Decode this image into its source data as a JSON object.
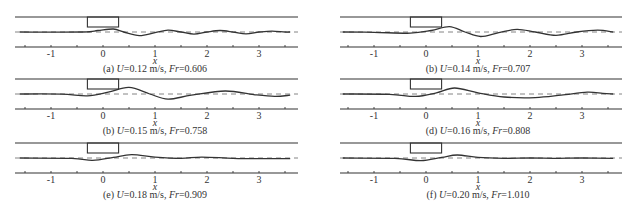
{
  "figure": {
    "x_axis_label": "x",
    "x_ticks": [
      "-1",
      "0",
      "1",
      "2",
      "3"
    ],
    "x_tick_values": [
      -1,
      0,
      1,
      2,
      3
    ],
    "x_range": [
      -1.6,
      3.6
    ]
  },
  "chart_data": [
    {
      "type": "line",
      "id": "a",
      "title": "(a) U=0.12 m/s, Fr=0.606",
      "caption_prefix": "(a) ",
      "U": "0.12",
      "Fr": "0.606",
      "xlabel": "x",
      "xlim": [
        -1.6,
        3.6
      ],
      "obstacle": {
        "x_start": -0.3,
        "x_end": 0.3
      },
      "series": [
        {
          "name": "free surface",
          "x": [
            -1.6,
            -0.4,
            -0.1,
            0.2,
            0.4,
            0.7,
            1.0,
            1.25,
            1.5,
            1.75,
            2.0,
            2.25,
            2.5,
            2.75,
            3.0,
            3.25,
            3.5,
            3.6
          ],
          "y": [
            0,
            0,
            0.25,
            0.5,
            0,
            -0.6,
            -0.1,
            0.3,
            0,
            -0.35,
            0,
            0.25,
            0,
            -0.3,
            0,
            0.15,
            0,
            0
          ]
        },
        {
          "name": "still water level",
          "style": "dashed",
          "y": 0
        }
      ]
    },
    {
      "type": "line",
      "id": "b1",
      "title": "(b) U=0.14 m/s, Fr=0.707",
      "caption_prefix": "(b) ",
      "U": "0.14",
      "Fr": "0.707",
      "xlabel": "x",
      "xlim": [
        -1.6,
        3.6
      ],
      "obstacle": {
        "x_start": -0.3,
        "x_end": 0.3
      },
      "series": [
        {
          "name": "free surface",
          "x": [
            -1.6,
            -1.0,
            -0.3,
            0.1,
            0.45,
            0.75,
            1.05,
            1.4,
            1.75,
            2.1,
            2.5,
            2.9,
            3.3,
            3.6
          ],
          "y": [
            0,
            -0.05,
            -0.2,
            0.25,
            0.9,
            0,
            -0.75,
            -0.1,
            0.45,
            0,
            -0.55,
            0,
            0.3,
            0
          ]
        },
        {
          "name": "still water level",
          "style": "dashed",
          "y": 0
        }
      ]
    },
    {
      "type": "line",
      "id": "b2",
      "title": "(b) U=0.15 m/s, Fr=0.758",
      "caption_prefix": "(b) ",
      "U": "0.15",
      "Fr": "0.758",
      "xlabel": "x",
      "xlim": [
        -1.6,
        3.6
      ],
      "obstacle": {
        "x_start": -0.3,
        "x_end": 0.3
      },
      "series": [
        {
          "name": "free surface",
          "x": [
            -1.6,
            -0.8,
            -0.3,
            0.1,
            0.5,
            0.9,
            1.25,
            1.7,
            2.35,
            2.9,
            3.3,
            3.6
          ],
          "y": [
            0,
            -0.02,
            -0.3,
            0.3,
            1.1,
            0,
            -0.85,
            -0.2,
            0.5,
            -0.1,
            -0.4,
            -0.2
          ]
        },
        {
          "name": "still water level",
          "style": "dashed",
          "y": 0
        }
      ]
    },
    {
      "type": "line",
      "id": "d",
      "title": "(d) U=0.16 m/s, Fr=0.808",
      "caption_prefix": "(d) ",
      "U": "0.16",
      "Fr": "0.808",
      "xlabel": "x",
      "xlim": [
        -1.6,
        3.6
      ],
      "obstacle": {
        "x_start": -0.3,
        "x_end": 0.3
      },
      "series": [
        {
          "name": "free surface",
          "x": [
            -1.6,
            -0.7,
            -0.2,
            0.2,
            0.55,
            1.0,
            1.5,
            2.1,
            2.6,
            3.1,
            3.4,
            3.6
          ],
          "y": [
            0,
            -0.05,
            -0.4,
            0.2,
            1.0,
            0.2,
            -0.5,
            -0.6,
            -0.2,
            0.3,
            0.1,
            0
          ]
        },
        {
          "name": "still water level",
          "style": "dashed",
          "y": 0
        }
      ]
    },
    {
      "type": "line",
      "id": "e",
      "title": "(e) U=0.18 m/s, Fr=0.909",
      "caption_prefix": "(e) ",
      "U": "0.18",
      "Fr": "0.909",
      "xlabel": "x",
      "xlim": [
        -1.6,
        3.6
      ],
      "obstacle": {
        "x_start": -0.3,
        "x_end": 0.3
      },
      "series": [
        {
          "name": "free surface",
          "x": [
            -1.6,
            -0.6,
            -0.2,
            0.2,
            0.55,
            1.0,
            1.5,
            1.9,
            2.5,
            3.0,
            3.6
          ],
          "y": [
            0,
            -0.05,
            -0.4,
            0.1,
            0.55,
            0.15,
            -0.05,
            0.15,
            -0.05,
            -0.1,
            -0.1
          ]
        },
        {
          "name": "still water level",
          "style": "dashed",
          "y": 0
        }
      ]
    },
    {
      "type": "line",
      "id": "f",
      "title": "(f) U=0.20 m/s, Fr=1.010",
      "caption_prefix": "(f) ",
      "U": "0.20",
      "Fr": "1.010",
      "xlabel": "x",
      "xlim": [
        -1.6,
        3.6
      ],
      "obstacle": {
        "x_start": -0.3,
        "x_end": 0.3
      },
      "series": [
        {
          "name": "free surface",
          "x": [
            -1.6,
            -0.6,
            -0.1,
            0.3,
            0.6,
            1.0,
            1.5,
            2.0,
            2.5,
            3.0,
            3.6
          ],
          "y": [
            0,
            -0.05,
            -0.45,
            0.1,
            0.5,
            0.1,
            -0.05,
            0,
            -0.05,
            0,
            -0.05
          ]
        },
        {
          "name": "still water level",
          "style": "dashed",
          "y": 0
        }
      ]
    }
  ]
}
